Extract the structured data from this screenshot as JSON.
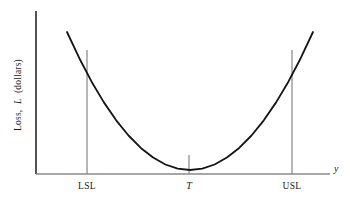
{
  "figure": {
    "background_color": "#ffffff",
    "width": 350,
    "height": 200
  },
  "chart_data": {
    "type": "line",
    "title": "",
    "subtitle": "",
    "xlabel": "y",
    "ylabel": "Loss, L (dollars)",
    "ylabel_parts": {
      "prefix": "Loss,",
      "variable": "L",
      "suffix": "(dollars)"
    },
    "curve_description": "Quadratic (Taguchi) loss function, L = k(y - T)^2, minimum at target T",
    "x": [
      -1.0,
      -0.9,
      -0.8,
      -0.7,
      -0.6,
      -0.5,
      -0.4,
      -0.3,
      -0.2,
      -0.1,
      0.0,
      0.1,
      0.2,
      0.3,
      0.4,
      0.5,
      0.6,
      0.7,
      0.8,
      0.9,
      1.0
    ],
    "y": [
      1.0,
      0.81,
      0.64,
      0.49,
      0.36,
      0.25,
      0.16,
      0.09,
      0.04,
      0.01,
      0.0,
      0.01,
      0.04,
      0.09,
      0.16,
      0.25,
      0.36,
      0.49,
      0.64,
      0.81,
      1.0
    ],
    "xlim": [
      -1.15,
      1.3
    ],
    "ylim": [
      0,
      1.06
    ],
    "grid": false,
    "legend": null,
    "series": [
      {
        "name": "Loss function",
        "color": "#141414",
        "line_width": 1.8,
        "values": [
          1.0,
          0.81,
          0.64,
          0.49,
          0.36,
          0.25,
          0.16,
          0.09,
          0.04,
          0.01,
          0.0,
          0.01,
          0.04,
          0.09,
          0.16,
          0.25,
          0.36,
          0.49,
          0.64,
          0.81,
          1.0
        ]
      }
    ],
    "reference_lines": [
      {
        "id": "lsl",
        "label": "LSL",
        "x": -0.67,
        "color": "#7a7a7a",
        "style": "solid",
        "y_top": 0.95,
        "y_bottom": 0.0
      },
      {
        "id": "target",
        "label": "T",
        "x": 0.0,
        "color": "#7a7a7a",
        "style": "solid",
        "y_top": 0.14,
        "y_bottom": 0.0
      },
      {
        "id": "usl",
        "label": "USL",
        "x": 0.67,
        "color": "#7a7a7a",
        "style": "solid",
        "y_top": 0.95,
        "y_bottom": 0.0
      }
    ],
    "tick_labels": {
      "x": [
        "LSL",
        "T",
        "USL"
      ]
    },
    "axis_colors": {
      "y_axis": "#1a1a1a",
      "x_axis": "#8a8a8a"
    }
  }
}
